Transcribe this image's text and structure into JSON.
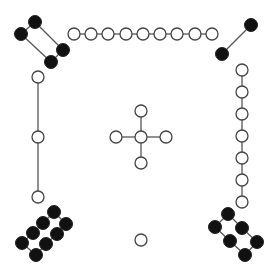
{
  "diagram": {
    "type": "graph",
    "width": 274,
    "height": 278,
    "colors": {
      "background": "#ffffff",
      "edge": "#555555",
      "open_fill": "#ffffff",
      "open_stroke": "#444444",
      "filled": "#111111"
    },
    "components": [
      {
        "name": "top-left-ring",
        "style": "filled",
        "radius": 6.5,
        "nodes": [
          [
            35,
            22
          ],
          [
            21,
            34
          ],
          [
            63,
            50
          ],
          [
            51,
            62
          ]
        ],
        "edges": [
          [
            0,
            1
          ],
          [
            0,
            2
          ],
          [
            1,
            3
          ],
          [
            2,
            3
          ]
        ]
      },
      {
        "name": "top-chain",
        "style": "open",
        "radius": 6,
        "nodes": [
          [
            74,
            34
          ],
          [
            91,
            34
          ],
          [
            108,
            34
          ],
          [
            126,
            34
          ],
          [
            143,
            34
          ],
          [
            160,
            34
          ],
          [
            177,
            34
          ],
          [
            195,
            34
          ],
          [
            212,
            34
          ]
        ],
        "edges": [
          [
            0,
            1
          ],
          [
            1,
            2
          ],
          [
            2,
            3
          ],
          [
            3,
            4
          ],
          [
            4,
            5
          ],
          [
            5,
            6
          ],
          [
            6,
            7
          ],
          [
            7,
            8
          ]
        ]
      },
      {
        "name": "top-right-pair",
        "style": "filled",
        "radius": 6.5,
        "nodes": [
          [
            251,
            25
          ],
          [
            222,
            54
          ]
        ],
        "edges": [
          [
            0,
            1
          ]
        ]
      },
      {
        "name": "left-chain",
        "style": "open",
        "radius": 6,
        "nodes": [
          [
            38,
            77
          ],
          [
            38,
            137
          ],
          [
            38,
            197
          ]
        ],
        "edges": [
          [
            0,
            1
          ],
          [
            1,
            2
          ]
        ]
      },
      {
        "name": "right-chain",
        "style": "open",
        "radius": 6,
        "nodes": [
          [
            242,
            70
          ],
          [
            242,
            92
          ],
          [
            242,
            114
          ],
          [
            242,
            136
          ],
          [
            242,
            158
          ],
          [
            242,
            180
          ],
          [
            242,
            202
          ]
        ],
        "edges": [
          [
            0,
            1
          ],
          [
            1,
            2
          ],
          [
            2,
            3
          ],
          [
            3,
            4
          ],
          [
            4,
            5
          ],
          [
            5,
            6
          ]
        ]
      },
      {
        "name": "center-star",
        "style": "open",
        "radius": 6,
        "nodes": [
          [
            141,
            137
          ],
          [
            141,
            111
          ],
          [
            141,
            163
          ],
          [
            116,
            137
          ],
          [
            166,
            137
          ]
        ],
        "edges": [
          [
            0,
            1
          ],
          [
            0,
            2
          ],
          [
            0,
            3
          ],
          [
            0,
            4
          ]
        ]
      },
      {
        "name": "bottom-left-ladder",
        "style": "filled",
        "radius": 6.5,
        "nodes": [
          [
            54,
            212
          ],
          [
            43,
            223
          ],
          [
            33,
            233
          ],
          [
            22,
            243
          ],
          [
            66,
            224
          ],
          [
            57,
            234
          ],
          [
            46,
            244
          ],
          [
            36,
            255
          ]
        ],
        "edges": [
          [
            0,
            1
          ],
          [
            1,
            2
          ],
          [
            2,
            3
          ],
          [
            4,
            5
          ],
          [
            5,
            6
          ],
          [
            6,
            7
          ],
          [
            0,
            4
          ],
          [
            3,
            7
          ]
        ]
      },
      {
        "name": "bottom-right-ladder",
        "style": "filled",
        "radius": 6.5,
        "nodes": [
          [
            228,
            214
          ],
          [
            242,
            228
          ],
          [
            257,
            242
          ],
          [
            215,
            227
          ],
          [
            230,
            241
          ],
          [
            245,
            255
          ]
        ],
        "edges": [
          [
            0,
            1
          ],
          [
            1,
            2
          ],
          [
            3,
            4
          ],
          [
            4,
            5
          ],
          [
            0,
            3
          ],
          [
            2,
            5
          ]
        ]
      },
      {
        "name": "isolated-node",
        "style": "open",
        "radius": 6,
        "nodes": [
          [
            141,
            240
          ]
        ],
        "edges": []
      }
    ]
  }
}
